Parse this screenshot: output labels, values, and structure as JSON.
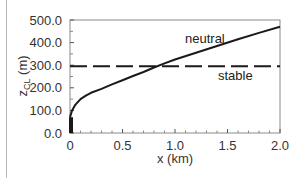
{
  "chart_data": {
    "type": "line",
    "title": "",
    "xlabel": "x (km)",
    "ylabel": "zCL (m)",
    "ylabel_main": "z",
    "ylabel_sub": "CL",
    "ylabel_unit": " (m)",
    "xlim": [
      0,
      2.0
    ],
    "ylim": [
      0,
      500
    ],
    "grid": false,
    "legend": "inline labels",
    "x_ticks": [
      "0",
      "0.5",
      "1.0",
      "1.5",
      "2.0"
    ],
    "y_ticks": [
      "0.0",
      "100.0",
      "200.0",
      "300.0",
      "400.0",
      "500.0"
    ],
    "series": [
      {
        "name": "neutral",
        "style": "solid",
        "x": [
          0.0,
          0.02,
          0.05,
          0.1,
          0.15,
          0.2,
          0.3,
          0.4,
          0.5,
          0.6,
          0.7,
          0.8,
          0.9,
          1.0,
          1.2,
          1.4,
          1.6,
          1.8,
          2.0
        ],
        "values": [
          70,
          100,
          125,
          150,
          165,
          178,
          195,
          215,
          233,
          252,
          270,
          290,
          308,
          325,
          355,
          385,
          415,
          443,
          470
        ]
      },
      {
        "name": "stable",
        "style": "dashed",
        "x": [
          0.0,
          2.0
        ],
        "values": [
          295,
          295
        ]
      }
    ],
    "annotations": [
      {
        "type": "bar",
        "x": 0.0,
        "y0": 0,
        "y1": 70,
        "color": "#1a1a1a"
      }
    ],
    "labels": {
      "neutral": "neutral",
      "stable": "stable"
    }
  }
}
